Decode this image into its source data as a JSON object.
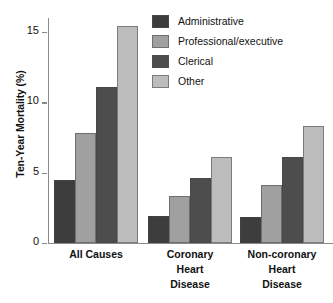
{
  "chart_data": {
    "type": "bar",
    "title": "",
    "xlabel": "",
    "ylabel": "Ten-Year Mortality (%)",
    "categories": [
      "All Causes",
      "Coronary Heart Disease",
      "Non-coronary Heart Disease"
    ],
    "category_lines": [
      [
        "All Causes"
      ],
      [
        "Coronary",
        "Heart",
        "Disease"
      ],
      [
        "Non-coronary",
        "Heart",
        "Disease"
      ]
    ],
    "series": [
      {
        "name": "Administrative",
        "color": "#3d3d3d",
        "values": [
          4.5,
          1.9,
          1.85
        ]
      },
      {
        "name": "Professional/executive",
        "color": "#a0a0a0",
        "values": [
          7.85,
          3.35,
          4.15
        ]
      },
      {
        "name": "Clerical",
        "color": "#4d4d4d",
        "values": [
          11.1,
          4.65,
          6.1
        ]
      },
      {
        "name": "Other",
        "color": "#bcbcbc",
        "values": [
          15.4,
          6.1,
          8.3
        ]
      }
    ],
    "ylim": [
      0,
      16
    ],
    "yticks": [
      0,
      5,
      10,
      15
    ],
    "ytick_labels": [
      "0",
      "5",
      "10",
      "15"
    ],
    "grid": false,
    "legend_position": "top-right",
    "axis_color": "#8a8a8a"
  },
  "legend": {
    "items": [
      {
        "label": "Administrative"
      },
      {
        "label": "Professional/executive"
      },
      {
        "label": "Clerical"
      },
      {
        "label": "Other"
      }
    ]
  }
}
